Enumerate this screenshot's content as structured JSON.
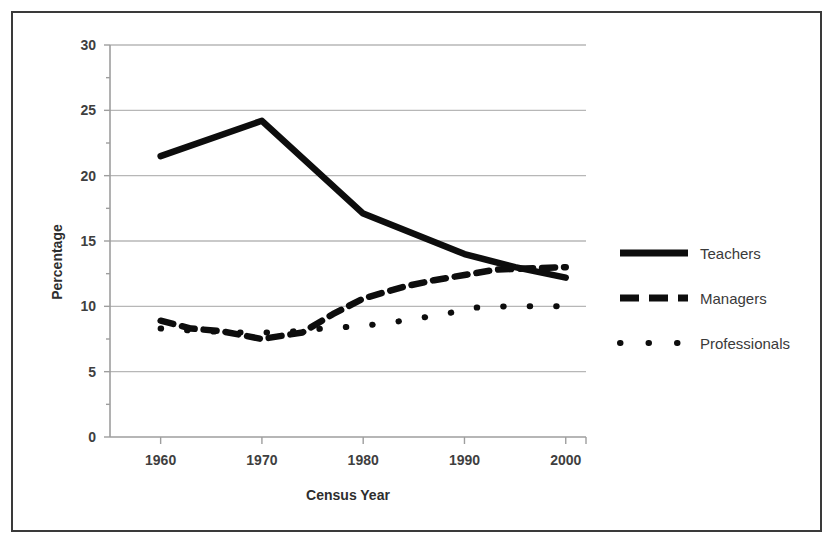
{
  "chart_data": {
    "type": "line",
    "title": "",
    "xlabel": "Census Year",
    "ylabel": "Percentage",
    "xlim": [
      1955,
      2002
    ],
    "ylim": [
      0,
      30
    ],
    "ytick_labels": [
      "0",
      "5",
      "10",
      "15",
      "20",
      "25",
      "30"
    ],
    "ytick_values": [
      0,
      5,
      10,
      15,
      20,
      25,
      30
    ],
    "xtick_labels": [
      "1960",
      "1970",
      "1980",
      "1990",
      "2000"
    ],
    "xtick_values": [
      1960,
      1970,
      1980,
      1990,
      2000
    ],
    "grid": "horizontal",
    "legend_position": "right",
    "series": [
      {
        "name": "Teachers",
        "style": "solid",
        "x": [
          1960,
          1970,
          1980,
          1990,
          1995,
          2000
        ],
        "values": [
          21.5,
          24.2,
          17.1,
          14.0,
          13.0,
          12.2
        ]
      },
      {
        "name": "Managers",
        "style": "dashed",
        "x": [
          1960,
          1963,
          1966,
          1970,
          1974,
          1977,
          1980,
          1984,
          1987,
          1990,
          1993,
          1996,
          2000
        ],
        "values": [
          8.9,
          8.3,
          8.1,
          7.5,
          8.0,
          9.4,
          10.6,
          11.5,
          12.0,
          12.4,
          12.8,
          12.9,
          13.0
        ]
      },
      {
        "name": "Professionals",
        "style": "dotted",
        "x": [
          1960,
          1964,
          1968,
          1972,
          1976,
          1980,
          1984,
          1988,
          1991,
          1994,
          1997,
          2000
        ],
        "values": [
          8.3,
          8.1,
          8.0,
          8.0,
          8.3,
          8.5,
          8.9,
          9.4,
          9.9,
          10.0,
          10.0,
          10.0
        ]
      }
    ]
  },
  "legend": {
    "items": [
      {
        "label": "Teachers",
        "style": "solid"
      },
      {
        "label": "Managers",
        "style": "dashed"
      },
      {
        "label": "Professionals",
        "style": "dotted"
      }
    ]
  },
  "axes": {
    "y_title": "Percentage",
    "x_title": "Census Year"
  }
}
